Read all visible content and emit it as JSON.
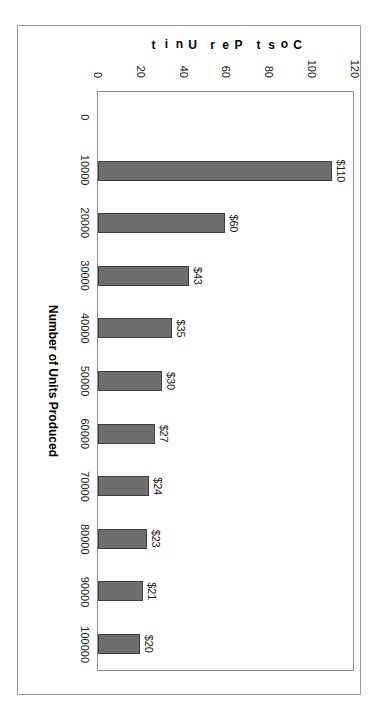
{
  "chart_data": {
    "type": "bar",
    "title": "",
    "subtitle": "",
    "xlabel": "Number of Units Produced",
    "ylabel": "Cost Per Unit",
    "orientation": "vertical-bars-rotated-90deg-clockwise",
    "categories": [
      "0",
      "10000",
      "20000",
      "30000",
      "40000",
      "50000",
      "60000",
      "70000",
      "80000",
      "90000",
      "100000"
    ],
    "values": [
      null,
      110,
      60,
      43,
      35,
      30,
      27,
      24,
      23,
      21,
      20
    ],
    "data_labels": [
      "",
      "$110",
      "$60",
      "$43",
      "$35",
      "$30",
      "$27",
      "$24",
      "$23",
      "$21",
      "$20"
    ],
    "series": [
      {
        "name": "Cost Per Unit",
        "values": [
          null,
          110,
          60,
          43,
          35,
          30,
          27,
          24,
          23,
          21,
          20
        ]
      }
    ],
    "ylim": [
      0,
      120
    ],
    "ytick_labels": [
      "0",
      "20",
      "40",
      "60",
      "80",
      "100",
      "120"
    ],
    "ytick_values": [
      0,
      20,
      40,
      60,
      80,
      100,
      120
    ],
    "grid": false,
    "legend": false,
    "legend_position": "none",
    "colors": {
      "bar_fill": "#6e6e6e",
      "bar_border": "#3f3f3f",
      "plot_border": "#8c8c8c",
      "chart_border": "#9a9a9a",
      "background": "#ffffff",
      "text": "#1a1a1a"
    }
  },
  "axis_title_letters": {
    "ylabel_chars": [
      "C",
      "o",
      "s",
      "t",
      " ",
      "P",
      "e",
      "r",
      " ",
      "U",
      "n",
      "i",
      "t"
    ]
  }
}
